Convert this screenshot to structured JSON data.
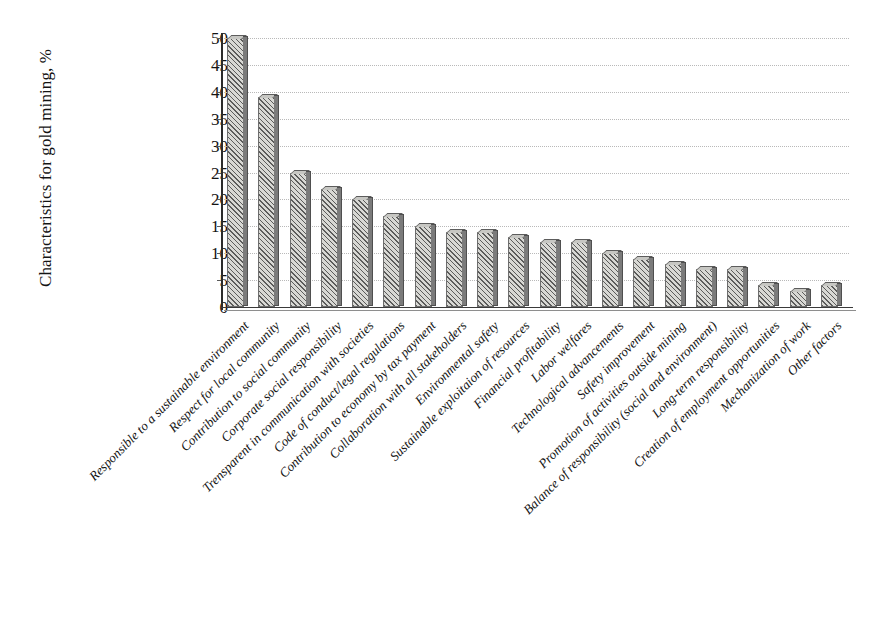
{
  "chart_data": {
    "type": "bar",
    "title": "",
    "xlabel": "",
    "ylabel": "Characteristics for gold mining, %",
    "ylim": [
      0,
      50
    ],
    "yticks": [
      0,
      5,
      10,
      15,
      20,
      25,
      30,
      35,
      40,
      45,
      50
    ],
    "grid": true,
    "legend": "none",
    "orientation": "vertical",
    "bar_style": {
      "fill": "#d8d8d4",
      "hatch": "diagonal-45",
      "edge": "#6d6d6d",
      "shadow": "#7b7b7b",
      "three_d": true
    },
    "categories": [
      "Responsible to a sustainable environment",
      "Respect for local community",
      "Contribution to social community",
      "Corporate social responsibility",
      "Trensparent in communication with societies",
      "Code of conduct/legal regulations",
      "Contribution to economy by tax payment",
      "Collaboration with all stakeholders",
      "Environmental safety",
      "Sustainable exploitaion of resources",
      "Financial profitability",
      "Labor welfares",
      "Technological advancements",
      "Safety improvement",
      "Promotion of activities outside mining",
      "Balance of responsibility (social and environment)",
      "Long-term responsibility",
      "Creation of employment opportunities",
      "Mechanization of work",
      "Other factors"
    ],
    "values": [
      50,
      39,
      25,
      22,
      20,
      17,
      15,
      14,
      14,
      13,
      12,
      12,
      10,
      9,
      8,
      7,
      7,
      4,
      3,
      4
    ],
    "ytick_labels": [
      "0",
      "5",
      "10",
      "15",
      "20",
      "25",
      "30",
      "35",
      "40",
      "45",
      "50"
    ]
  }
}
